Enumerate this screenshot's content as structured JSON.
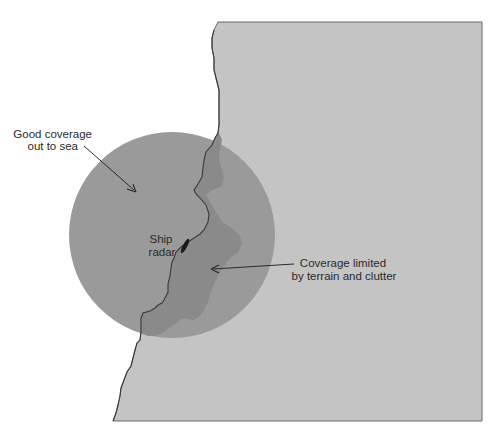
{
  "diagram": {
    "type": "radar coverage illustration",
    "colors": {
      "background": "#ffffff",
      "land": "#c4c4c4",
      "coverage_sea": "#9a9a9a",
      "coverage_land_limited": "#8a8a8a",
      "coastline": "#3a3a3a",
      "text": "#2a2a2a"
    },
    "labels": {
      "good_coverage_line1": "Good coverage",
      "good_coverage_line2": "out to sea",
      "ship_line1": "Ship",
      "ship_line2": "radar",
      "limited_line1": "Coverage limited",
      "limited_line2": "by terrain and clutter"
    },
    "elements": [
      "land-mass",
      "radar-coverage-circle",
      "terrain-limited-coverage",
      "coastline",
      "ship-icon",
      "annotation-arrows"
    ]
  }
}
